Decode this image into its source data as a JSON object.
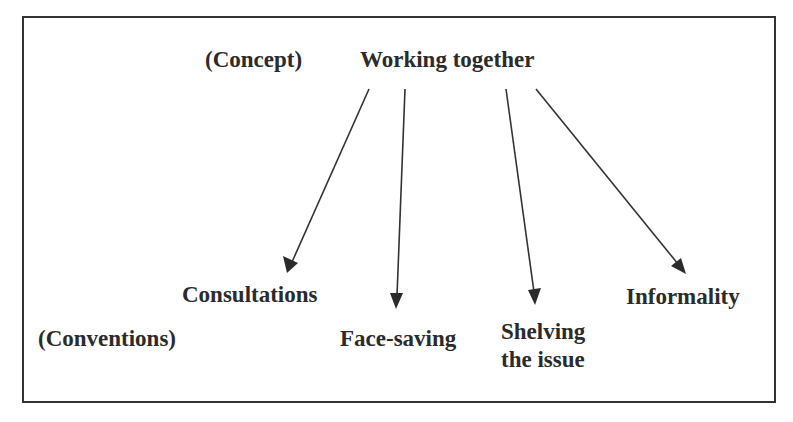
{
  "diagram": {
    "concept_tag": "(Concept)",
    "concept": "Working together",
    "conventions_tag": "(Conventions)",
    "conventions": [
      {
        "label": "Consultations"
      },
      {
        "label": "Face-saving"
      },
      {
        "label_line1": "Shelving",
        "label_line2": "the issue"
      },
      {
        "label": "Informality"
      }
    ],
    "colors": {
      "line": "#333333",
      "text": "#2b2b2b",
      "background": "#ffffff"
    }
  }
}
